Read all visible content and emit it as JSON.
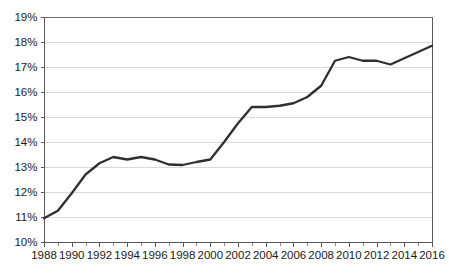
{
  "chart_data": {
    "type": "line",
    "title": "",
    "subtitle": "",
    "xlabel": "",
    "ylabel": "",
    "xlim": [
      1988,
      2016
    ],
    "ylim": [
      10,
      19
    ],
    "y_tick_step": 1,
    "x_tick_step": 2,
    "x_minor_tick_step": 1,
    "grid": "horizontal",
    "legend": "none",
    "value_suffix": "%",
    "line_color": "#2f2f2f",
    "gridline_color": "#d9d9d9",
    "axis_color": "#58595b",
    "background_color": "#ffffff",
    "y_tick_labels": [
      "19%",
      "18%",
      "17%",
      "16%",
      "15%",
      "14%",
      "13%",
      "12%",
      "11%",
      "10%"
    ],
    "y_tick_values": [
      19,
      18,
      17,
      16,
      15,
      14,
      13,
      12,
      11,
      10
    ],
    "x_tick_labels": [
      "1988",
      "1990",
      "1992",
      "1994",
      "1996",
      "1998",
      "2000",
      "2002",
      "2004",
      "2006",
      "2008",
      "2010",
      "2012",
      "2014",
      "2016"
    ],
    "x_tick_values": [
      1988,
      1990,
      1992,
      1994,
      1996,
      1998,
      2000,
      2002,
      2004,
      2006,
      2008,
      2010,
      2012,
      2014,
      2016
    ],
    "x": [
      1988,
      1989,
      1990,
      1991,
      1992,
      1993,
      1994,
      1995,
      1996,
      1997,
      1998,
      1999,
      2000,
      2001,
      2002,
      2003,
      2004,
      2005,
      2006,
      2007,
      2008,
      2009,
      2010,
      2011,
      2012,
      2013,
      2014,
      2015,
      2016
    ],
    "values": [
      10.95,
      11.25,
      11.95,
      12.7,
      13.15,
      13.4,
      13.3,
      13.4,
      13.3,
      13.1,
      13.08,
      13.2,
      13.3,
      14.0,
      14.75,
      15.4,
      15.4,
      15.45,
      15.55,
      15.8,
      16.25,
      17.25,
      17.4,
      17.25,
      17.25,
      17.1,
      17.35,
      17.6,
      17.85
    ],
    "series": [
      {
        "name": "series-1",
        "values": [
          10.95,
          11.25,
          11.95,
          12.7,
          13.15,
          13.4,
          13.3,
          13.4,
          13.3,
          13.1,
          13.08,
          13.2,
          13.3,
          14.0,
          14.75,
          15.4,
          15.4,
          15.45,
          15.55,
          15.8,
          16.25,
          17.25,
          17.4,
          17.25,
          17.25,
          17.1,
          17.35,
          17.6,
          17.85
        ]
      }
    ]
  },
  "plot": {
    "left": 44,
    "right": 432,
    "top": 17,
    "bottom": 242
  }
}
